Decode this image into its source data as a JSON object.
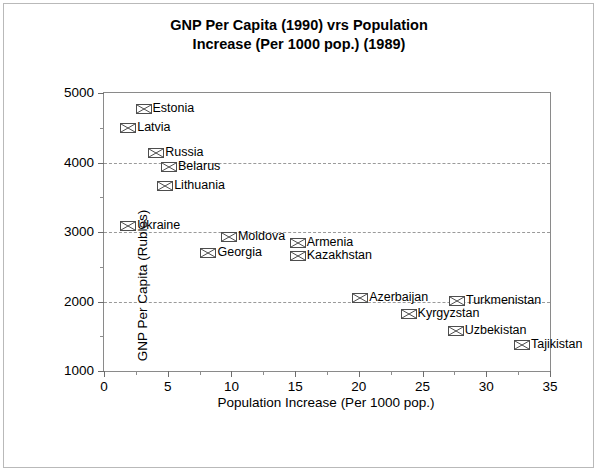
{
  "chart_data": {
    "type": "scatter",
    "title": "GNP Per Capita (1990) vrs Population\nIncrease (Per 1000 pop.) (1989)",
    "xlabel": "Population Increase (Per 1000 pop.)",
    "ylabel": "GNP Per Capita (Rubles)",
    "xlim": [
      0,
      35
    ],
    "ylim": [
      1000,
      5000
    ],
    "x_ticks": [
      0,
      5,
      10,
      15,
      20,
      25,
      30,
      35
    ],
    "x_minor_ticks": [
      2.5,
      7.5,
      12.5,
      17.5,
      22.5,
      27.5,
      32.5
    ],
    "y_ticks": [
      1000,
      2000,
      3000,
      4000,
      5000
    ],
    "y_minor_ticks": [
      1500,
      2500,
      3500,
      4500
    ],
    "grid": "horizontal-dashed-at-major-y",
    "legend": "none",
    "marker_style": "square-with-x",
    "points": [
      {
        "label": "Estonia",
        "x": 3.1,
        "y": 4770
      },
      {
        "label": "Latvia",
        "x": 1.9,
        "y": 4490
      },
      {
        "label": "Russia",
        "x": 4.1,
        "y": 4130
      },
      {
        "label": "Belarus",
        "x": 5.1,
        "y": 3940
      },
      {
        "label": "Lithuania",
        "x": 4.8,
        "y": 3660
      },
      {
        "label": "Ukraine",
        "x": 1.9,
        "y": 3090
      },
      {
        "label": "Moldova",
        "x": 9.8,
        "y": 2930
      },
      {
        "label": "Georgia",
        "x": 8.2,
        "y": 2700
      },
      {
        "label": "Armenia",
        "x": 15.2,
        "y": 2840
      },
      {
        "label": "Kazakhstan",
        "x": 15.2,
        "y": 2650
      },
      {
        "label": "Azerbaijan",
        "x": 20.1,
        "y": 2050
      },
      {
        "label": "Kyrgyzstan",
        "x": 23.9,
        "y": 1820
      },
      {
        "label": "Turkmenistan",
        "x": 27.7,
        "y": 2010
      },
      {
        "label": "Uzbekistan",
        "x": 27.6,
        "y": 1570
      },
      {
        "label": "Tajikistan",
        "x": 32.8,
        "y": 1370
      }
    ]
  }
}
